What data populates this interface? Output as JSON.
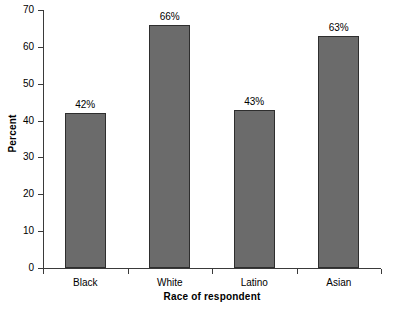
{
  "chart_data": {
    "type": "bar",
    "title": "",
    "categories": [
      "Black",
      "White",
      "Latino",
      "Asian"
    ],
    "values": [
      42,
      66,
      43,
      63
    ],
    "value_labels": [
      "42%",
      "66%",
      "43%",
      "63%"
    ],
    "xlabel": "Race of respondent",
    "ylabel": "Percent",
    "ylim": [
      0,
      70
    ],
    "yticks": [
      0,
      10,
      20,
      30,
      40,
      50,
      60,
      70
    ],
    "ytick_labels": [
      "0",
      "10",
      "20",
      "30",
      "40",
      "50",
      "60",
      "70"
    ],
    "grid": false,
    "legend": null,
    "bar_color": "#6b6b6b",
    "bar_edge_color": "#2e2e2e",
    "axis_color": "#3a3a3a",
    "background": "#ffffff"
  }
}
